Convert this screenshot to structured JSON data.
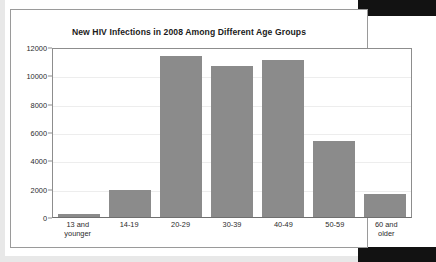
{
  "chart_data": {
    "type": "bar",
    "title": "New HIV Infections in 2008 Among Different Age Groups",
    "xlabel": "",
    "ylabel": "",
    "categories": [
      "13 and younger",
      "14-19",
      "20-29",
      "30-39",
      "40-49",
      "50-59",
      "60 and older"
    ],
    "category_lines": [
      [
        "13 and",
        "younger"
      ],
      [
        "14-19",
        ""
      ],
      [
        "20-29",
        ""
      ],
      [
        "30-39",
        ""
      ],
      [
        "40-49",
        ""
      ],
      [
        "50-59",
        ""
      ],
      [
        "60 and",
        "older"
      ]
    ],
    "values": [
      220,
      1900,
      11400,
      10650,
      11100,
      5360,
      1620
    ],
    "ylim": [
      0,
      12000
    ],
    "yticks": [
      0,
      2000,
      4000,
      6000,
      8000,
      10000,
      12000
    ],
    "ytick_labels": [
      "0",
      "2000",
      "4000",
      "6000",
      "8000",
      "10000",
      "12000"
    ],
    "grid": true,
    "legend": false,
    "bar_color": "#8b8b8b",
    "axis_color": "#8d8d8d",
    "grid_color": "#ededed",
    "text_color": "#2b2b2b",
    "background": "#ffffff"
  }
}
